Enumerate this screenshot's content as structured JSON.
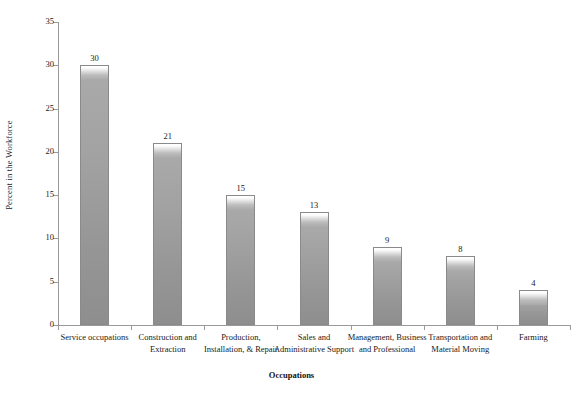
{
  "chart_data": {
    "type": "bar",
    "title": "",
    "xlabel": "Occupations",
    "ylabel": "Percent in the Workforce",
    "categories": [
      "Service occupations",
      "Construction and Extraction",
      "Production, Installation, & Repair",
      "Sales and Administrative Support",
      "Management, Business and Professional",
      "Transportation and Material Moving",
      "Farming"
    ],
    "values": [
      30,
      21,
      15,
      13,
      9,
      8,
      4
    ],
    "value_labels": [
      "30",
      "21",
      "15",
      "13",
      "9",
      "8",
      "4"
    ],
    "ylim": [
      0,
      35
    ],
    "ytick_values": [
      0,
      5,
      10,
      15,
      20,
      25,
      30,
      35
    ],
    "ytick_labels": [
      "0",
      "5",
      "10",
      "15",
      "20",
      "25",
      "30",
      "35"
    ],
    "grid": false,
    "legend": null,
    "bar_color": "#a0a0a0",
    "axis_color": "#9a9a9a",
    "text_color": "#1a1a1a",
    "background": "#ffffff"
  },
  "axis": {
    "y_title": "Percent in the Workforce",
    "x_title": "Occupations"
  }
}
